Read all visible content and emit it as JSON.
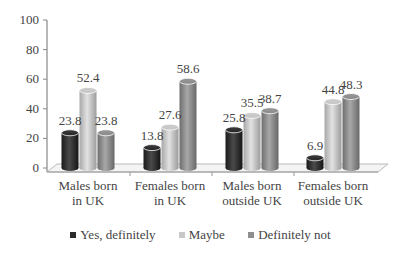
{
  "chart_data": {
    "type": "bar",
    "style": "3d-cylinder",
    "title": "",
    "xlabel": "",
    "ylabel": "",
    "ylim": [
      0,
      100
    ],
    "yticks": [
      0,
      20,
      40,
      60,
      80,
      100
    ],
    "grid": false,
    "legend_position": "bottom",
    "categories": [
      [
        "Males born",
        "in UK"
      ],
      [
        "Females born",
        "in UK"
      ],
      [
        "Males born",
        "outside UK"
      ],
      [
        "Females born",
        "outside UK"
      ]
    ],
    "series": [
      {
        "name": "Yes, definitely",
        "color": "#2b2b2b",
        "values": [
          23.8,
          13.8,
          25.8,
          6.9
        ]
      },
      {
        "name": "Maybe",
        "color": "#c8c8c8",
        "values": [
          52.4,
          27.6,
          35.5,
          44.8
        ]
      },
      {
        "name": "Definitely not",
        "color": "#8e8e8e",
        "values": [
          23.8,
          58.6,
          38.7,
          48.3
        ]
      }
    ]
  },
  "legend": {
    "items": [
      {
        "label": "Yes, definitely",
        "color": "#2b2b2b"
      },
      {
        "label": "Maybe",
        "color": "#c8c8c8"
      },
      {
        "label": "Definitely not",
        "color": "#8e8e8e"
      }
    ]
  }
}
